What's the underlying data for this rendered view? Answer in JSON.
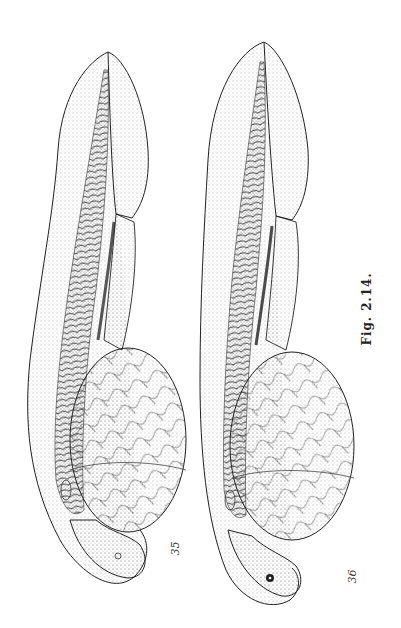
{
  "figure": {
    "caption": "Fig.  2.14.",
    "panels": [
      {
        "id": "35",
        "label": "35",
        "subject": "fish embryo with yolk sac (lateral view)"
      },
      {
        "id": "36",
        "label": "36",
        "subject": "fish embryo with yolk sac (lateral view)"
      }
    ],
    "style": {
      "ink": "#1a1a1a",
      "paper": "#ffffff"
    }
  }
}
